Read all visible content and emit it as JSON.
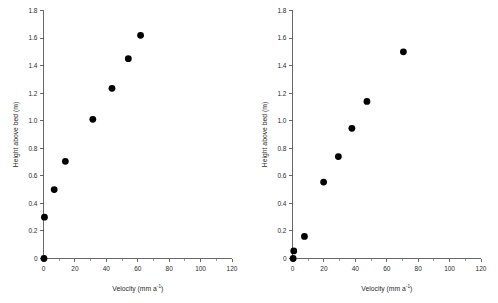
{
  "figure": {
    "background_color": "#ffffff",
    "marker_color": "#000000",
    "axis_color": "#5a5a5a",
    "panel_count": 2
  },
  "chart_data": [
    {
      "type": "scatter",
      "panel": "left",
      "title": "",
      "xlabel": "Velocity (mm a-1)",
      "xlabel_base": "Velocity (mm a",
      "xlabel_sup": "-1",
      "xlabel_tail": ")",
      "ylabel": "Height above bed (m)",
      "xlim": [
        0,
        120
      ],
      "ylim": [
        0,
        1.8
      ],
      "xticks": [
        0,
        20,
        40,
        60,
        80,
        100,
        120
      ],
      "xticklabels": [
        "0",
        "20",
        "40",
        "60",
        "80",
        "100",
        "120"
      ],
      "xminorticks": [
        10,
        30,
        50,
        70,
        90,
        110
      ],
      "yticks": [
        0,
        0.2,
        0.4,
        0.6,
        0.8,
        1.0,
        1.2,
        1.4,
        1.6,
        1.8
      ],
      "yticklabels": [
        "0",
        "0.2",
        "0.4",
        "0.6",
        "0.8",
        "1.0",
        "1.2",
        "1.4",
        "1.6",
        "1.8"
      ],
      "grid": false,
      "legend": null,
      "series": [
        {
          "name": "Velocity profile",
          "marker": "filled-circle",
          "color": "#000000",
          "points": [
            {
              "x": 0.3,
              "y": 0.0
            },
            {
              "x": 0.6,
              "y": 0.3
            },
            {
              "x": 6.8,
              "y": 0.5
            },
            {
              "x": 13.9,
              "y": 0.705
            },
            {
              "x": 31.4,
              "y": 1.01
            },
            {
              "x": 43.6,
              "y": 1.235
            },
            {
              "x": 54.0,
              "y": 1.45
            },
            {
              "x": 61.8,
              "y": 1.62
            }
          ]
        }
      ]
    },
    {
      "type": "scatter",
      "panel": "right",
      "title": "",
      "xlabel": "Velocity (mm a-1)",
      "xlabel_base": "Velocity (mm a",
      "xlabel_sup": "-1",
      "xlabel_tail": ")",
      "ylabel": "Height above bed (m)",
      "xlim": [
        0,
        120
      ],
      "ylim": [
        0,
        1.8
      ],
      "xticks": [
        0,
        20,
        40,
        60,
        80,
        100,
        120
      ],
      "xticklabels": [
        "0",
        "20",
        "40",
        "60",
        "80",
        "100",
        "120"
      ],
      "xminorticks": [
        10,
        30,
        50,
        70,
        90,
        110
      ],
      "yticks": [
        0,
        0.2,
        0.4,
        0.6,
        0.8,
        1.0,
        1.2,
        1.4,
        1.6,
        1.8
      ],
      "yticklabels": [
        "0",
        "0.2",
        "0.4",
        "0.6",
        "0.8",
        "1.0",
        "1.2",
        "1.4",
        "1.6",
        "1.8"
      ],
      "grid": false,
      "legend": null,
      "series": [
        {
          "name": "Velocity profile",
          "marker": "filled-circle",
          "color": "#000000",
          "points": [
            {
              "x": 0.4,
              "y": 0.0
            },
            {
              "x": 0.8,
              "y": 0.055
            },
            {
              "x": 7.6,
              "y": 0.16
            },
            {
              "x": 19.8,
              "y": 0.555
            },
            {
              "x": 29.2,
              "y": 0.74
            },
            {
              "x": 37.8,
              "y": 0.945
            },
            {
              "x": 47.4,
              "y": 1.14
            },
            {
              "x": 70.6,
              "y": 1.5
            }
          ]
        }
      ]
    }
  ]
}
